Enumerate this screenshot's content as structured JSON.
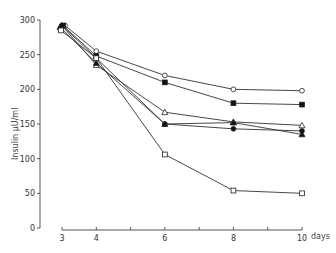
{
  "chart_data": {
    "type": "line",
    "title": "",
    "xlabel": "days",
    "ylabel": "Insulin µU/ml",
    "x": [
      3,
      4,
      6,
      8,
      10
    ],
    "xlim": [
      3,
      10
    ],
    "ylim": [
      0,
      300
    ],
    "xticks": [
      "3",
      "4",
      "6",
      "8",
      "10"
    ],
    "yticks": [
      "0",
      "50",
      "100",
      "150",
      "200",
      "250",
      "300"
    ],
    "grid": false,
    "legend": "none",
    "series": [
      {
        "name": "open circle",
        "marker": "circle-open",
        "values": [
          292,
          255,
          220,
          200,
          198
        ]
      },
      {
        "name": "filled square",
        "marker": "square-filled",
        "values": [
          292,
          248,
          210,
          180,
          178
        ]
      },
      {
        "name": "open triangle",
        "marker": "triangle-open",
        "values": [
          292,
          235,
          167,
          153,
          148
        ]
      },
      {
        "name": "filled triangle",
        "marker": "triangle-filled",
        "values": [
          290,
          238,
          150,
          152,
          135
        ]
      },
      {
        "name": "filled circle",
        "marker": "circle-filled",
        "values": [
          292,
          245,
          150,
          143,
          140
        ]
      },
      {
        "name": "open square",
        "marker": "square-open",
        "values": [
          285,
          245,
          106,
          54,
          50
        ]
      }
    ]
  }
}
